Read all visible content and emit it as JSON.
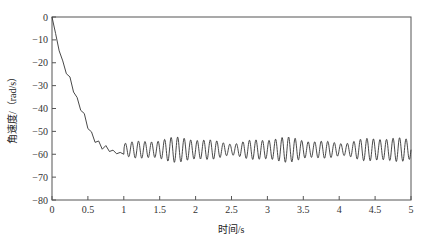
{
  "chart_data": {
    "type": "line",
    "title": "",
    "xlabel": "时间/s",
    "ylabel": "角速度/（rad/s）",
    "xlim": [
      0,
      5
    ],
    "ylim": [
      -80,
      0
    ],
    "xticks": [
      0,
      0.5,
      1,
      1.5,
      2,
      2.5,
      3,
      3.5,
      4,
      4.5,
      5
    ],
    "xtick_labels": [
      "0",
      "0.5",
      "1",
      "1.5",
      "2",
      "2.5",
      "3",
      "3.5",
      "4",
      "4.5",
      "5"
    ],
    "yticks": [
      0,
      -10,
      -20,
      -30,
      -40,
      -50,
      -60,
      -70,
      -80
    ],
    "ytick_labels": [
      "0",
      "−10",
      "−20",
      "−30",
      "−40",
      "−50",
      "−60",
      "−70",
      "−80"
    ],
    "grid": false,
    "legend": null,
    "series": [
      {
        "name": "angular velocity",
        "color": "#333333",
        "description": "Drops almost linearly from 0 to about -55 rad/s by t≈0.65 s, settles near -58 to -60 around t≈0.8–1.0 s, then oscillates between about -54 and -62 rad/s until t=5 s (~11 cycles per second).",
        "x": [
          0,
          0.05,
          0.1,
          0.15,
          0.2,
          0.25,
          0.3,
          0.35,
          0.4,
          0.45,
          0.5,
          0.55,
          0.6,
          0.65,
          0.7,
          0.75,
          0.8,
          0.85,
          0.9,
          0.95,
          1.0
        ],
        "y": [
          0,
          -8,
          -14,
          -20,
          -24,
          -27,
          -32,
          -36,
          -40,
          -43,
          -48,
          -51,
          -54,
          -55,
          -57,
          -57,
          -58,
          -59,
          -59,
          -60,
          -60
        ],
        "steady_state": {
          "start": 1.0,
          "end": 5.0,
          "mean": -58,
          "amplitude": 4,
          "frequency_hz": 11
        }
      }
    ]
  }
}
